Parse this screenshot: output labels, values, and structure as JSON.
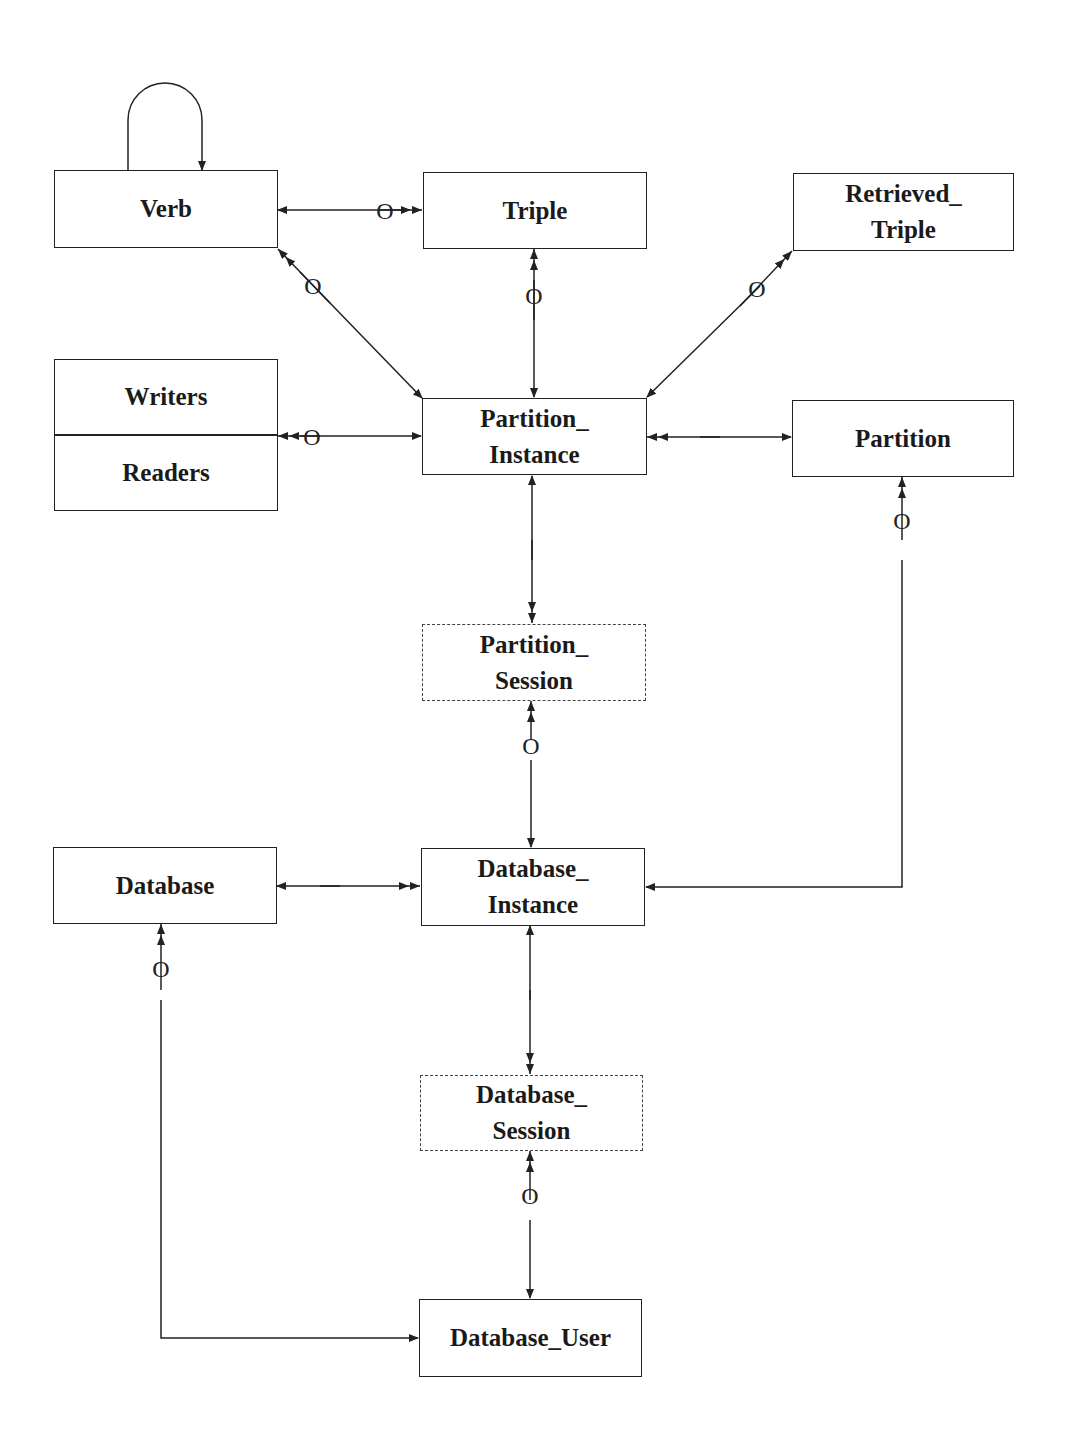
{
  "diagram": {
    "type": "entity-relationship",
    "entities": [
      {
        "id": "verb",
        "lines": [
          "Verb"
        ],
        "style": "solid"
      },
      {
        "id": "triple",
        "lines": [
          "Triple"
        ],
        "style": "solid"
      },
      {
        "id": "retrieved_triple",
        "lines": [
          "Retrieved_",
          "Triple"
        ],
        "style": "solid"
      },
      {
        "id": "writers_readers",
        "lines": [
          "Writers",
          "Readers"
        ],
        "style": "split"
      },
      {
        "id": "partition_instance",
        "lines": [
          "Partition_",
          "Instance"
        ],
        "style": "solid"
      },
      {
        "id": "partition",
        "lines": [
          "Partition"
        ],
        "style": "solid"
      },
      {
        "id": "partition_session",
        "lines": [
          "Partition_",
          "Session"
        ],
        "style": "dashed"
      },
      {
        "id": "database",
        "lines": [
          "Database"
        ],
        "style": "solid"
      },
      {
        "id": "database_instance",
        "lines": [
          "Database_",
          "Instance"
        ],
        "style": "solid"
      },
      {
        "id": "database_session",
        "lines": [
          "Database_",
          "Session"
        ],
        "style": "dashed"
      },
      {
        "id": "database_user",
        "lines": [
          "Database_User"
        ],
        "style": "solid"
      }
    ],
    "optional_marker": "O",
    "relationships": [
      {
        "from": "verb",
        "to": "verb",
        "kind": "self-loop"
      },
      {
        "from": "verb",
        "to": "triple",
        "many_side": "triple",
        "optional": true
      },
      {
        "from": "partition_instance",
        "to": "verb",
        "many_side": "verb",
        "optional": true
      },
      {
        "from": "partition_instance",
        "to": "triple",
        "many_side": "triple",
        "optional": true
      },
      {
        "from": "partition_instance",
        "to": "retrieved_triple",
        "many_side": "retrieved_triple",
        "optional": true
      },
      {
        "from": "partition_instance",
        "to": "writers_readers",
        "many_side": "writers_readers",
        "optional": true
      },
      {
        "from": "partition",
        "to": "partition_instance",
        "many_side": "partition_instance"
      },
      {
        "from": "partition_instance",
        "to": "partition_session",
        "many_side": "partition_session"
      },
      {
        "from": "database_instance",
        "to": "partition_session",
        "many_side": "partition_session",
        "optional": true
      },
      {
        "from": "database_instance",
        "to": "partition",
        "many_side": "partition",
        "optional": true
      },
      {
        "from": "database",
        "to": "database_instance",
        "many_side": "database_instance"
      },
      {
        "from": "database_instance",
        "to": "database_session",
        "many_side": "database_session"
      },
      {
        "from": "database_user",
        "to": "database_session",
        "many_side": "database_session",
        "optional": true
      },
      {
        "from": "database_user",
        "to": "database",
        "many_side": "database",
        "optional": true
      }
    ]
  }
}
